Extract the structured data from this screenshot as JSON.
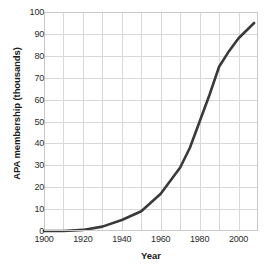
{
  "chart_data": {
    "type": "line",
    "title": "",
    "xlabel": "Year",
    "ylabel": "APA membership (thousands)",
    "xlim": [
      1900,
      2010
    ],
    "ylim": [
      0,
      100
    ],
    "grid": true,
    "legend": false,
    "line_color": "#3a3a3a",
    "grid_color": "#d8d8d8",
    "frame_color": "#c9c9c9",
    "x_ticks_major": [
      1900,
      1920,
      1940,
      1960,
      1980,
      2000
    ],
    "x_ticks_minor": [
      1910,
      1930,
      1950,
      1970,
      1990,
      2010
    ],
    "x_tick_labels": [
      "1900",
      "1920",
      "1940",
      "1960",
      "1980",
      "2000"
    ],
    "y_ticks": [
      0,
      10,
      20,
      30,
      40,
      50,
      60,
      70,
      80,
      90,
      100
    ],
    "y_tick_labels": [
      "0",
      "10",
      "20",
      "30",
      "40",
      "50",
      "60",
      "70",
      "80",
      "90",
      "100"
    ],
    "x": [
      1900,
      1910,
      1920,
      1930,
      1940,
      1950,
      1960,
      1970,
      1975,
      1980,
      1985,
      1990,
      1995,
      2000,
      2008
    ],
    "values": [
      0,
      0,
      0.5,
      2,
      5,
      9,
      17,
      29,
      38,
      50,
      62,
      75,
      82,
      88,
      95
    ],
    "series": [
      {
        "name": "APA membership",
        "values": [
          0,
          0,
          0.5,
          2,
          5,
          9,
          17,
          29,
          38,
          50,
          62,
          75,
          82,
          88,
          95
        ]
      }
    ]
  }
}
